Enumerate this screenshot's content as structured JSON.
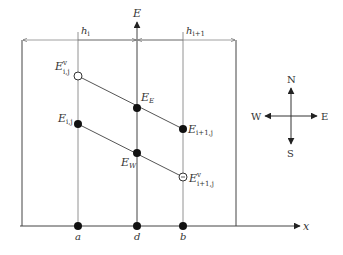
{
  "diagram": {
    "axis": {
      "vertical_label": "E",
      "horizontal_label": "x"
    },
    "dimensions": [
      {
        "label": "h",
        "sub": "i"
      },
      {
        "label": "h",
        "sub": "i+1"
      }
    ],
    "x_points": [
      {
        "id": "a",
        "label": "a"
      },
      {
        "id": "d",
        "label": "d"
      },
      {
        "id": "b",
        "label": "b"
      }
    ],
    "nodes": [
      {
        "id": "E_v_ij",
        "main": "E",
        "sup": "v",
        "sub": "i,j",
        "type": "open"
      },
      {
        "id": "E_E",
        "main": "E",
        "sub": "E",
        "type": "filled"
      },
      {
        "id": "E_i1j",
        "main": "E",
        "sub": "i+1,j",
        "type": "filled"
      },
      {
        "id": "E_ij",
        "main": "E",
        "sub": "i,j",
        "type": "filled"
      },
      {
        "id": "E_W",
        "main": "E",
        "sub": "W",
        "type": "filled"
      },
      {
        "id": "E_v_i1j",
        "main": "E",
        "sup": "v",
        "sub": "i+1,j",
        "type": "open"
      }
    ],
    "compass": {
      "north": "N",
      "south": "S",
      "east": "E",
      "west": "W"
    }
  }
}
